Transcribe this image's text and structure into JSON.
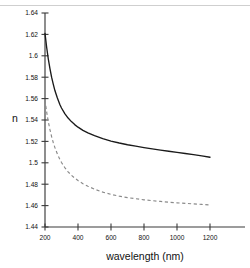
{
  "chart_data": {
    "type": "line",
    "title": "",
    "subtitle": "",
    "xlabel": "wavelength (nm)",
    "ylabel": "n",
    "xlim": [
      150,
      1300
    ],
    "ylim": [
      1.44,
      1.64
    ],
    "grid": false,
    "legend": "none",
    "xticks": [
      200,
      400,
      600,
      800,
      1000,
      1200
    ],
    "xtick_labels": [
      "200",
      "400",
      "600",
      "800",
      "1000",
      "1200"
    ],
    "yticks": [
      1.44,
      1.46,
      1.48,
      1.5,
      1.52,
      1.54,
      1.56,
      1.58,
      1.6,
      1.62,
      1.64
    ],
    "ytick_labels": [
      "1.44",
      "1.46",
      "1.48",
      "1.5",
      "1.52",
      "1.54",
      "1.56",
      "1.58",
      "1.6",
      "1.62",
      "1.64"
    ],
    "series": [
      {
        "name": "upper-dispersion-curve",
        "style": "solid",
        "color": "#1a1a1a",
        "x": [
          200,
          210,
          220,
          230,
          240,
          250,
          260,
          275,
          290,
          300,
          320,
          340,
          360,
          380,
          400,
          430,
          460,
          500,
          550,
          600,
          650,
          700,
          750,
          800,
          850,
          900,
          950,
          1000,
          1050,
          1100,
          1150,
          1200
        ],
        "y": [
          1.621,
          1.608,
          1.597,
          1.588,
          1.58,
          1.5735,
          1.5675,
          1.5605,
          1.5545,
          1.5512,
          1.546,
          1.5418,
          1.5385,
          1.5357,
          1.5333,
          1.5303,
          1.528,
          1.5253,
          1.5225,
          1.5203,
          1.5185,
          1.5169,
          1.5155,
          1.5142,
          1.513,
          1.5119,
          1.5108,
          1.5098,
          1.5087,
          1.5076,
          1.5064,
          1.5052
        ]
      },
      {
        "name": "lower-dispersion-curve",
        "style": "dashed",
        "color": "#8a8a8a",
        "x": [
          200,
          210,
          220,
          230,
          240,
          250,
          260,
          275,
          290,
          300,
          320,
          340,
          360,
          380,
          400,
          430,
          460,
          500,
          550,
          600,
          650,
          700,
          750,
          800,
          850,
          900,
          950,
          1000,
          1050,
          1100,
          1150,
          1200
        ],
        "y": [
          1.5585,
          1.5475,
          1.5385,
          1.531,
          1.5245,
          1.519,
          1.5142,
          1.5082,
          1.5032,
          1.5003,
          1.4955,
          1.4916,
          1.4884,
          1.4857,
          1.4834,
          1.4805,
          1.4781,
          1.4754,
          1.4726,
          1.4705,
          1.4688,
          1.4675,
          1.4664,
          1.4654,
          1.4646,
          1.4639,
          1.4632,
          1.4626,
          1.4621,
          1.4616,
          1.4611,
          1.4606
        ]
      }
    ]
  },
  "geometry": {
    "plot_left": 45,
    "plot_right": 210,
    "axis_extend_right": 245,
    "plot_top": 13,
    "plot_bottom": 227
  }
}
